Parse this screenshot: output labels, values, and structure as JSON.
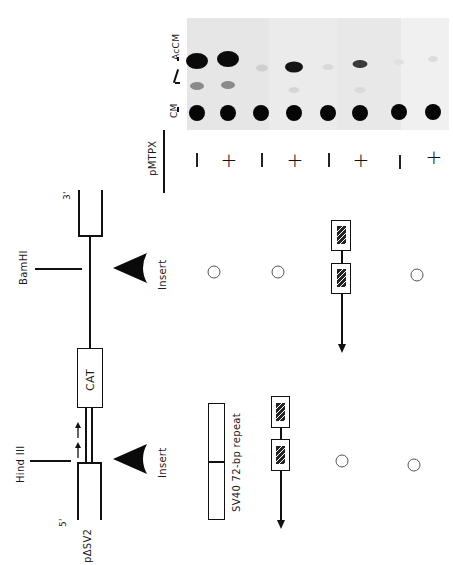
{
  "figure": {
    "gel": {
      "markers": {
        "accm_label": "AcCM",
        "cm_label": "CM"
      },
      "factor_label": "pMTPX",
      "lanes": [
        {
          "treatment": "−",
          "accm_top": "strong",
          "mid": "medium",
          "cm": "strong"
        },
        {
          "treatment": "+",
          "accm_top": "strong",
          "mid": "medium",
          "cm": "strong"
        },
        {
          "treatment": "−",
          "accm_top": "faint",
          "mid": "none",
          "cm": "strong"
        },
        {
          "treatment": "+",
          "accm_top": "strong",
          "mid": "faint",
          "cm": "strong"
        },
        {
          "treatment": "−",
          "accm_top": "faint",
          "mid": "none",
          "cm": "strong"
        },
        {
          "treatment": "+",
          "accm_top": "medium",
          "mid": "faint",
          "cm": "strong"
        },
        {
          "treatment": "−",
          "accm_top": "very-faint",
          "mid": "none",
          "cm": "strong"
        },
        {
          "treatment": "+",
          "accm_top": "very-faint",
          "mid": "none",
          "cm": "strong"
        }
      ],
      "signs": [
        "−",
        "+",
        "−",
        "+",
        "−",
        "+",
        "−",
        "+"
      ]
    },
    "construct": {
      "name": "pΔSV2",
      "five_prime": "5'",
      "three_prime": "3'",
      "gene_label": "CAT",
      "site_left": "Hind III",
      "site_right": "BamHI",
      "insert_label_left": "Insert",
      "insert_label_right": "Insert",
      "legend_label": "SV40 72-bp repeat"
    },
    "insert_rows": [
      {
        "hind3_site": "72bp-repeat-pair",
        "bamhi_site": "none"
      },
      {
        "hind3_site": "none",
        "bamhi_site": "none"
      },
      {
        "hind3_site": "none",
        "bamhi_site": "72bp-repeat-pair"
      },
      {
        "hind3_site": "none",
        "bamhi_site": "none"
      }
    ],
    "colors": {
      "ink": "#111111",
      "gel_bg": "#e9e9e9",
      "spot": "#0a0a0a"
    }
  }
}
